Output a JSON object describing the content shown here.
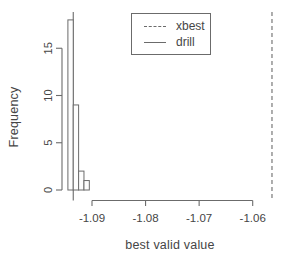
{
  "chart_data": {
    "type": "bar",
    "subtype": "histogram",
    "title": "",
    "xlabel": "best valid value",
    "ylabel": "Frequency",
    "x_ticks": {
      "values": [
        -1.09,
        -1.08,
        -1.07,
        -1.06
      ],
      "labels": [
        "-1.09",
        "-1.08",
        "-1.07",
        "-1.06"
      ]
    },
    "y_ticks": {
      "values": [
        0,
        5,
        10,
        15
      ],
      "labels": [
        "0",
        "5",
        "10",
        "15"
      ]
    },
    "bins": {
      "breaks": [
        -1.0945,
        -1.0935,
        -1.0925,
        -1.0915,
        -1.0905
      ],
      "counts": [
        18,
        9,
        2,
        1
      ]
    },
    "vlines": [
      {
        "name": "drill",
        "x": -1.0935,
        "style": "solid"
      },
      {
        "name": "xbest",
        "x": -1.0564,
        "style": "dashed"
      }
    ],
    "legend": {
      "position": "top-center",
      "entries": [
        {
          "label": "xbest",
          "line_style": "dashed"
        },
        {
          "label": "drill",
          "line_style": "solid"
        }
      ]
    },
    "xlim": [
      -1.0964,
      -1.0553
    ],
    "ylim": [
      0,
      18.6
    ],
    "grid": false
  },
  "colors": {
    "background": "#ffffff",
    "line": "#6b6b6b",
    "text": "#454545",
    "bar_fill": "#fdfdfd"
  }
}
